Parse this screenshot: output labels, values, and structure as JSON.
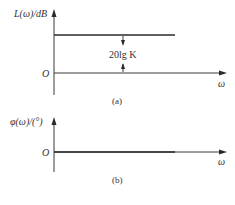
{
  "panel_a": {
    "y_label": "L(ω)/dB",
    "origin_label": "O",
    "x_label": "ω",
    "annotation": "20lg K",
    "caption": "(a)"
  },
  "panel_b": {
    "y_label": "φ(ω)/(°)",
    "origin_label": "O",
    "x_label": "ω",
    "caption": "(b)"
  },
  "colors": {
    "line": "#2a2a2a",
    "axis": "#3a3a3a",
    "text": "#333333",
    "background": "#ffffff"
  }
}
